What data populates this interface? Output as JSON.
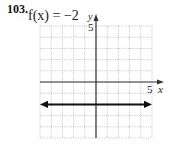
{
  "problem": {
    "number": "103.",
    "function_label": "f(x) = −2"
  },
  "chart_data": {
    "type": "line",
    "title": "f(x) = −2",
    "xlabel": "x",
    "ylabel": "y",
    "xlim": [
      -5,
      5
    ],
    "ylim": [
      -5,
      5
    ],
    "grid": true,
    "tick_labels": {
      "x": [
        "5"
      ],
      "y": [
        "5"
      ]
    },
    "series": [
      {
        "name": "f(x) = -2",
        "x": [
          -5,
          5
        ],
        "y": [
          -2,
          -2
        ],
        "arrows": "both"
      }
    ]
  },
  "labels": {
    "x_axis": "x",
    "y_axis": "y",
    "x_tick": "5",
    "y_tick": "5"
  },
  "colors": {
    "grid": "#9a9a9a",
    "axis": "#333333",
    "line": "#111111"
  }
}
